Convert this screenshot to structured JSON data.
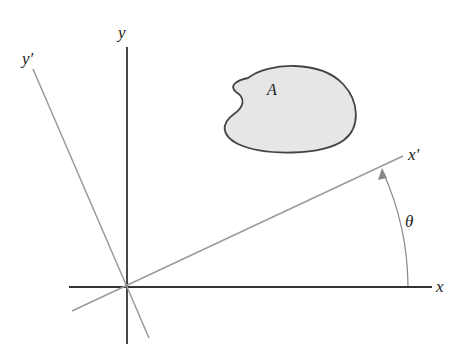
{
  "diagram": {
    "labels": {
      "x": "x",
      "y": "y",
      "x_prime": "x′",
      "y_prime": "y′",
      "area": "A",
      "angle": "θ"
    },
    "colors": {
      "axis": "#333333",
      "rotated_axis": "#9a9a9a",
      "area_fill": "#e6e6e6",
      "area_stroke": "#444444",
      "arc": "#888888"
    },
    "geometry": {
      "origin": [
        127,
        287
      ],
      "rotation_angle_deg": 25
    }
  }
}
